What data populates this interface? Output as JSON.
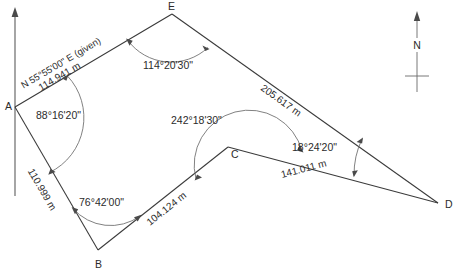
{
  "figure": {
    "type": "surveying-traverse-diagram",
    "background_color": "#ffffff",
    "line_color": "#3a3a3a",
    "text_color": "#2b2b2b"
  },
  "vertices": [
    {
      "id": "A",
      "label": "A",
      "x": 15,
      "y": 107,
      "label_x": 5,
      "label_y": 110
    },
    {
      "id": "B",
      "label": "B",
      "x": 98,
      "y": 250,
      "label_x": 95,
      "label_y": 268
    },
    {
      "id": "C",
      "label": "C",
      "x": 228,
      "y": 147,
      "label_x": 231,
      "label_y": 158
    },
    {
      "id": "D",
      "label": "D",
      "x": 438,
      "y": 203,
      "label_x": 445,
      "label_y": 208
    },
    {
      "id": "E",
      "label": "E",
      "x": 172,
      "y": 14,
      "label_x": 168,
      "label_y": 9
    }
  ],
  "sides": [
    {
      "from": "A",
      "to": "E",
      "length_label": "114.941 m",
      "bearing_label": "N 55°55'00\" E (given)"
    },
    {
      "from": "E",
      "to": "D",
      "length_label": "205.617 m"
    },
    {
      "from": "D",
      "to": "C",
      "length_label": "141.011 m"
    },
    {
      "from": "C",
      "to": "B",
      "length_label": "104.124 m"
    },
    {
      "from": "B",
      "to": "A",
      "length_label": "110.999 m"
    }
  ],
  "angles": [
    {
      "at": "A",
      "label": "88°16'20\""
    },
    {
      "at": "E",
      "label": "114°20'30\""
    },
    {
      "at": "C",
      "label": "242°18'30\""
    },
    {
      "at": "D",
      "label": "18°24'20\""
    },
    {
      "at": "B",
      "label": "76°42'00\""
    }
  ],
  "north": {
    "label": "N",
    "compass_x": 417,
    "compass_top_y": 12,
    "compass_bottom_y": 92
  },
  "meridian": {
    "x": 15,
    "top_y": 8,
    "bottom_y": 196
  }
}
